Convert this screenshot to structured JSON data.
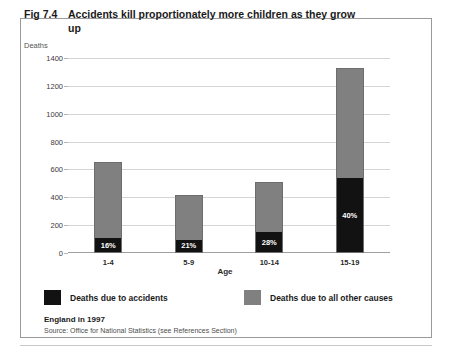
{
  "figure": {
    "number": "Fig 7.4",
    "title": "Accidents kill proportionately more children  as they grow up"
  },
  "chart_data": {
    "type": "bar",
    "title": "Accidents kill proportionately more children as they grow up",
    "xlabel": "Age",
    "ylabel": "Deaths",
    "ylim": [
      0,
      1400
    ],
    "ytick_step": 200,
    "yticks": [
      "1400",
      "1200",
      "1000",
      "800",
      "600",
      "400",
      "200",
      "0"
    ],
    "grid": true,
    "stacked": true,
    "legend_position": "bottom",
    "categories": [
      "1-4",
      "5-9",
      "10-14",
      "15-19"
    ],
    "series": [
      {
        "name": "Deaths due to accidents",
        "color": "#121212",
        "values": [
          104,
          88,
          143,
          532
        ]
      },
      {
        "name": "Deaths due to all other causes",
        "color": "#808080",
        "values": [
          546,
          332,
          367,
          798
        ]
      }
    ],
    "totals": [
      650,
      420,
      510,
      1330
    ],
    "data_labels": [
      "16%",
      "21%",
      "28%",
      "40%"
    ],
    "annotations": [
      {
        "category": "1-4",
        "label": "16%"
      },
      {
        "category": "5-9",
        "label": "21%"
      },
      {
        "category": "10-14",
        "label": "28%"
      },
      {
        "category": "15-19",
        "label": "40%"
      }
    ]
  },
  "legend": {
    "items": [
      {
        "label": "Deaths due to accidents",
        "color": "#121212"
      },
      {
        "label": "Deaths due to all other causes",
        "color": "#808080"
      }
    ]
  },
  "footer": {
    "main": "England in 1997",
    "source": "Source: Office for National Statistics (see References Section)"
  }
}
